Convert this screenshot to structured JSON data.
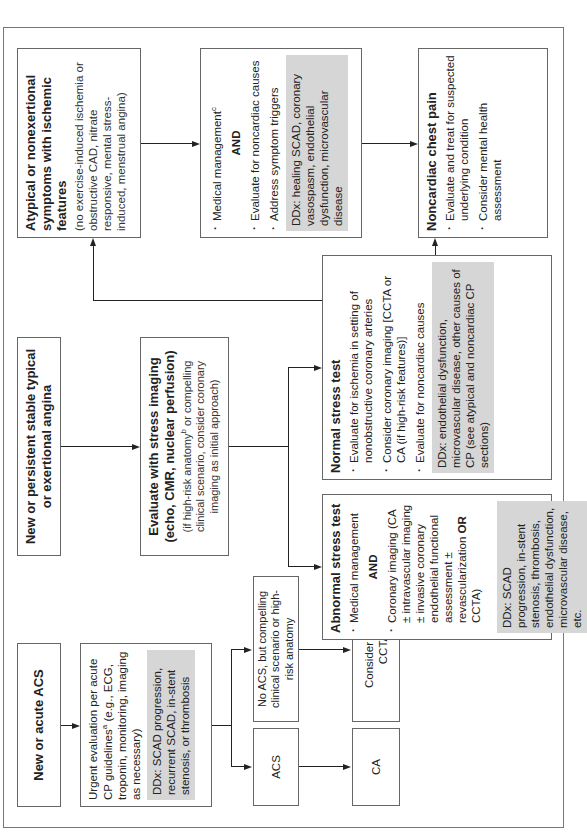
{
  "flowchart": {
    "orientation": "rotated -90deg",
    "colors": {
      "border": "#666666",
      "ddx_fill": "#d6d6d6",
      "line": "#222222"
    },
    "acs_branch": {
      "start": "New or acute ACS",
      "urgent_eval": {
        "text": "Urgent evaluation per acute CP guidelines",
        "sup": "a",
        "text2": " (e.g., ECG, troponin, monitoring, imaging as necessary)",
        "ddx": "DDx: SCAD progression, recurrent SCAD, in-stent stenosis, or thrombosis"
      },
      "acs": "ACS",
      "no_acs": "No ACS, but compelling clinical scenario or high-risk anatomy",
      "ca": "CA",
      "consider": "Consider CA or CCTA"
    },
    "stable_branch": {
      "start": "New or persistent stable typical or exertional angina",
      "stress_eval": {
        "title": "Evaluate with stress imaging (echo, CMR, nuclear perfusion)",
        "sub_a": "(if high-risk anatomy",
        "sup": "b",
        "sub_b": " or compelling clinical scenario, consider coronary imaging as initial approach)"
      },
      "abnormal": {
        "title": "Abnormal stress test",
        "item1": "Medical management",
        "and": "AND",
        "item2_a": "Coronary imaging (CA ± intravascular imaging ± invasive coronary endothelial functional assessment ± revascularization ",
        "item2_or": "OR",
        "item2_b": " CCTA)",
        "ddx": "DDx: SCAD progression, in-stent stenosis, thrombosis, endothelial dysfunction, microvascular disease, etc."
      },
      "normal": {
        "title": "Normal stress test",
        "item1": "Evaluate for ischemia in setting of nonobstructive coronary arteries",
        "item2": "Consider coronary imaging [CCTA or CA (if high-risk features)]",
        "item3": "Evaluate for noncardiac causes",
        "ddx": "DDx: endothelial dysfunction, microvascular disease, other causes of CP (see atypical and noncardiac CP sections)"
      }
    },
    "atypical_branch": {
      "start_title": "Atypical or nonexertional symptoms with ischemic features",
      "start_sub": "(no exercise-induced ischemia or obstructive CAD, nitrate responsive, mental stress-induced, menstrual angina)",
      "management": {
        "item1": "Medical management",
        "sup": "c",
        "and": "AND",
        "item2": "Evaluate for noncardiac causes",
        "item3": "Address symptom triggers",
        "ddx": "DDx: healing SCAD, coronary vasospasm, endothelial dysfunction, microvascular disease"
      }
    },
    "noncardiac": {
      "title": "Noncardiac chest pain",
      "item1": "Evaluate and treat for suspected underlying condition",
      "item2": "Consider mental health assessment"
    }
  }
}
